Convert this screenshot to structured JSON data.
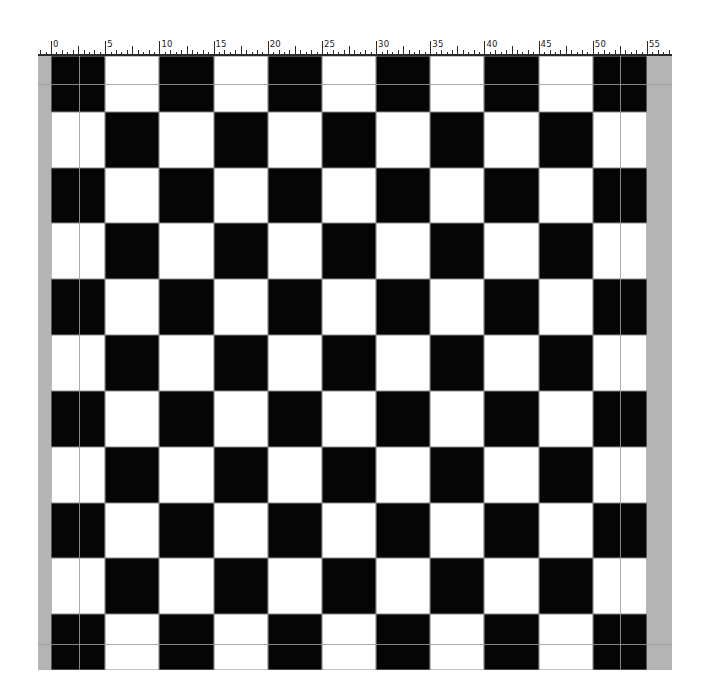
{
  "ruler": {
    "unit_px": 10.836,
    "origin_x": 51,
    "start_unit": -1.2,
    "end_unit": 57.2,
    "minor_step": 0.5,
    "mid_step": 2.5,
    "major_step": 5,
    "labels": [
      "0",
      "5",
      "10",
      "15",
      "20",
      "25",
      "30",
      "35",
      "40",
      "45",
      "50",
      "55"
    ]
  },
  "board": {
    "rows": 11,
    "columns": 11,
    "top_left_color": "black",
    "colors": {
      "black": "#050505",
      "white": "#ffffff",
      "cell_border": "#8a8a8a",
      "side_strip": "#b4b4b4",
      "guide": "#9c9c9c"
    }
  },
  "guides": {
    "vertical_x": [
      79,
      620
    ],
    "horizontal_y": [
      84,
      644
    ]
  }
}
